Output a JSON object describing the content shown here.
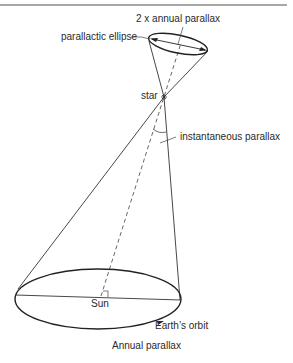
{
  "diagram": {
    "title": "Annual parallax",
    "labels": {
      "two_x_annual_parallax": "2 x annual parallax",
      "parallactic_ellipse": "parallactic ellipse",
      "star": "star",
      "instantaneous_parallax": "instantaneous parallax",
      "sun": "Sun",
      "earths_orbit": "Earth’s orbit",
      "caption": "Annual parallax"
    },
    "colors": {
      "line": "#333333",
      "dashed": "#555555",
      "text": "#2a2a2a",
      "rule": "#888888"
    }
  }
}
